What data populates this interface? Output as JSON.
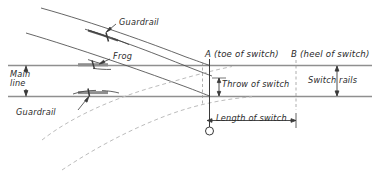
{
  "figure": {
    "type": "engineering-diagram",
    "background_color": "#ffffff",
    "ink_color": "#3a3a3a",
    "rail_color": "#8a8a8a",
    "dashed_color": "#b9b9b9",
    "width": 380,
    "height": 174
  },
  "labels": {
    "guardrail_upper": "Guardrail",
    "guardrail_lower": "Guardrail",
    "frog": "Frog",
    "main_line_line1": "Main",
    "main_line_line2": "line",
    "point_a": "A (toe of switch)",
    "point_b": "B (heel of switch)",
    "throw_of_switch": "Throw of switch",
    "switch_rails": "Switch rails",
    "length_of_switch": "Length of switch"
  },
  "points": {
    "a_letter": "A",
    "a_note": "(toe of switch)",
    "b_letter": "B",
    "b_note": "(heel of switch)"
  }
}
